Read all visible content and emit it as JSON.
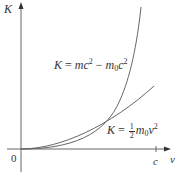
{
  "diagram": {
    "axes": {
      "y_label": "K",
      "x_label": "v",
      "origin_label": "0",
      "x_tick_label": "c"
    },
    "curves": [
      {
        "name": "relativistic",
        "equation": {
          "lhs": "K",
          "eq": "=",
          "term1_base": "mc",
          "term1_exp": "2",
          "minus": "−",
          "term2_m": "m",
          "term2_sub": "0",
          "term2_c": "c",
          "term2_exp": "2"
        }
      },
      {
        "name": "classical",
        "equation": {
          "lhs": "K",
          "eq": "=",
          "frac_num": "1",
          "frac_den": "2",
          "m": "m",
          "m_sub": "0",
          "v": "v",
          "v_exp": "2"
        }
      }
    ],
    "colors": {
      "axis": "#555555",
      "curve": "#666666",
      "text": "#333333"
    }
  }
}
